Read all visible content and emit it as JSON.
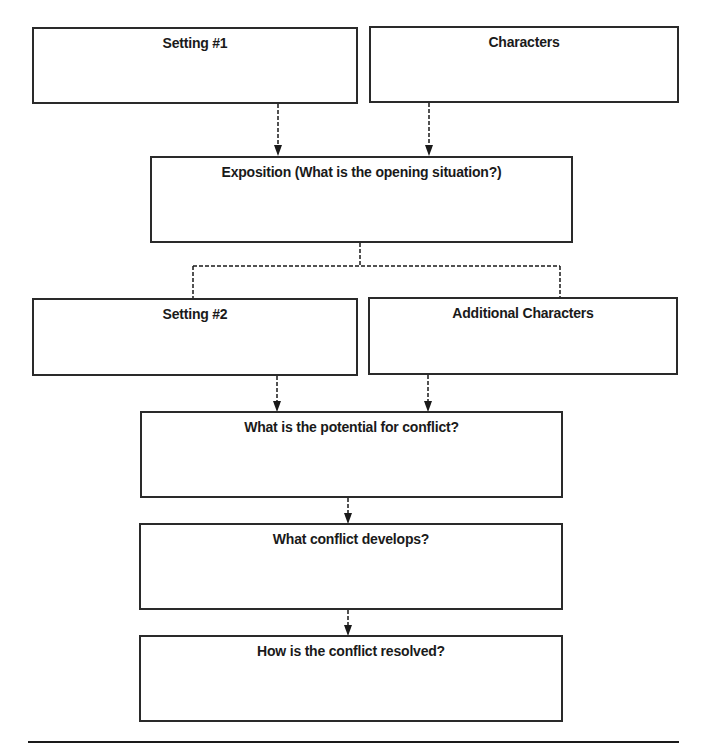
{
  "diagram": {
    "type": "story-map-flowchart",
    "colors": {
      "border": "#2a2a2a",
      "text": "#1a1a1a",
      "background": "#ffffff"
    },
    "boxes": [
      {
        "id": "setting-1",
        "title": "Setting #1",
        "content": ""
      },
      {
        "id": "characters",
        "title": "Characters",
        "content": ""
      },
      {
        "id": "exposition",
        "title": "Exposition (What is the opening situation?)",
        "content": ""
      },
      {
        "id": "setting-2",
        "title": "Setting #2",
        "content": ""
      },
      {
        "id": "additional-characters",
        "title": "Additional Characters",
        "content": ""
      },
      {
        "id": "potential-conflict",
        "title": "What is the potential for conflict?",
        "content": ""
      },
      {
        "id": "conflict-develops",
        "title": "What conflict develops?",
        "content": ""
      },
      {
        "id": "conflict-resolved",
        "title": "How is the conflict resolved?",
        "content": ""
      }
    ],
    "connections": [
      {
        "from": "setting-1",
        "to": "exposition",
        "style": "dashed-arrow"
      },
      {
        "from": "characters",
        "to": "exposition",
        "style": "dashed-arrow"
      },
      {
        "from": "exposition",
        "to": "setting-2",
        "style": "dashed-branch"
      },
      {
        "from": "exposition",
        "to": "additional-characters",
        "style": "dashed-branch"
      },
      {
        "from": "setting-2",
        "to": "potential-conflict",
        "style": "dashed-arrow"
      },
      {
        "from": "additional-characters",
        "to": "potential-conflict",
        "style": "dashed-arrow"
      },
      {
        "from": "potential-conflict",
        "to": "conflict-develops",
        "style": "dashed-arrow"
      },
      {
        "from": "conflict-develops",
        "to": "conflict-resolved",
        "style": "dashed-arrow"
      }
    ]
  }
}
